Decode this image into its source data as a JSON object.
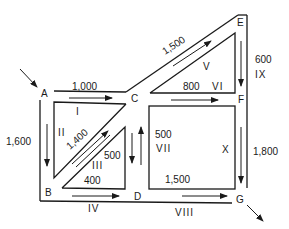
{
  "diagram": {
    "type": "network-flow",
    "nodes": [
      {
        "id": "A",
        "label": "A"
      },
      {
        "id": "B",
        "label": "B"
      },
      {
        "id": "C",
        "label": "C"
      },
      {
        "id": "D",
        "label": "D"
      },
      {
        "id": "E",
        "label": "E"
      },
      {
        "id": "F",
        "label": "F"
      },
      {
        "id": "G",
        "label": "G"
      }
    ],
    "edges": [
      {
        "from": "A",
        "to": "C",
        "value": "1,000",
        "region": "I"
      },
      {
        "from": "A",
        "to": "B",
        "value": "1,600",
        "region": "II"
      },
      {
        "from": "C",
        "to": "B",
        "value": "1,400",
        "region": "III"
      },
      {
        "from": "B",
        "to": "D",
        "value": "400",
        "region": "IV"
      },
      {
        "from": "D",
        "to": "C",
        "value": "500",
        "region": "III"
      },
      {
        "from": "C",
        "to": "E",
        "value": "1,500",
        "region": "V"
      },
      {
        "from": "C",
        "to": "F",
        "value": "800",
        "region": "VI"
      },
      {
        "from": "C",
        "to": "D",
        "value": "500",
        "region": "VII"
      },
      {
        "from": "E",
        "to": "F",
        "value": "600",
        "region": "IX"
      },
      {
        "from": "F",
        "to": "G",
        "value": "1,800",
        "region": "X"
      },
      {
        "from": "D",
        "to": "G",
        "value": "1,500",
        "region": "VIII"
      }
    ],
    "labels": {
      "node_A": "A",
      "node_B": "B",
      "node_C": "C",
      "node_D": "D",
      "node_E": "E",
      "node_F": "F",
      "node_G": "G",
      "val_AC": "1,000",
      "val_AB": "1,600",
      "val_CB": "1,400",
      "val_BD_inner": "400",
      "val_DC_inner": "500",
      "val_CE": "1,500",
      "val_CF": "800",
      "val_CD": "500",
      "val_EF": "600",
      "val_FG": "1,800",
      "val_DG": "1,500",
      "region_I": "I",
      "region_II": "II",
      "region_III": "III",
      "region_IV": "IV",
      "region_V": "V",
      "region_VI": "VI",
      "region_VII": "VII",
      "region_VIII": "VIII",
      "region_IX": "IX",
      "region_X": "X"
    }
  }
}
